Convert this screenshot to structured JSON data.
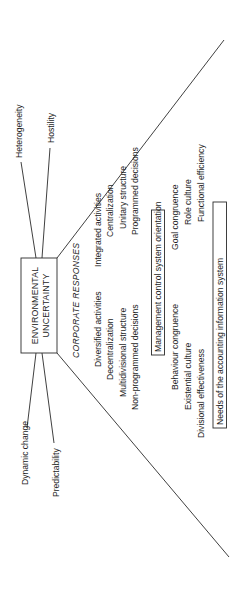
{
  "diagram": {
    "central_box": {
      "line1": "ENVIRONMENTAL",
      "line2": "UNCERTAINTY"
    },
    "environmental_factors": {
      "top": [
        "Heterogeneity",
        "Hostility"
      ],
      "bottom": [
        "Dynamic change",
        "Predictability"
      ]
    },
    "section_heading": "CORPORATE RESPONSES",
    "response_pairs": [
      {
        "left": "Diversified activities",
        "right": "Integrated activities"
      },
      {
        "left": "Decentralization",
        "right": "Centralization"
      },
      {
        "left": "Multidivisional structure",
        "right": "Unitary structure"
      },
      {
        "left": "Non-programmed decisions",
        "right": "Programmed decisions"
      }
    ],
    "mcs_box": "Management control system orientation",
    "mcs_pairs": [
      {
        "left": "Behaviour congruence",
        "right": "Goal congruence"
      },
      {
        "left": "Existential culture",
        "right": "Role culture"
      },
      {
        "left": "Divisional effectiveness",
        "right": "Functional efficiency"
      }
    ],
    "ais_box": "Needs of the accounting information system",
    "orientation": "rotated 90 degrees counter-clockwise"
  }
}
